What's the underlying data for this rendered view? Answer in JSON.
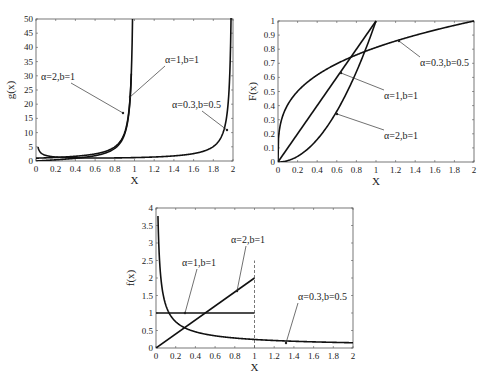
{
  "chart_data": [
    {
      "id": "hazard",
      "type": "line",
      "title": "",
      "xlabel": "X",
      "ylabel": "g(x)",
      "xlim": [
        0,
        2
      ],
      "ylim": [
        0,
        50
      ],
      "xticks": [
        "0",
        "0.2",
        "0.4",
        "0.6",
        "0.8",
        "1",
        "1.2",
        "1.4",
        "1.6",
        "1.8",
        "2"
      ],
      "yticks": [
        "0",
        "5",
        "10",
        "15",
        "20",
        "25",
        "30",
        "35",
        "40",
        "45",
        "50"
      ],
      "grid": false,
      "frame": {
        "left": 36,
        "right": 233,
        "top": 19,
        "bottom": 161
      },
      "series": [
        {
          "name": "α=2,b=1",
          "x": [
            0,
            0.2,
            0.4,
            0.6,
            0.8,
            0.9,
            0.95,
            0.97
          ],
          "values": [
            0,
            0.42,
            0.95,
            1.88,
            4.44,
            9.47,
            19.5,
            32.3
          ]
        },
        {
          "name": "α=1,b=1",
          "x": [
            0,
            0.2,
            0.4,
            0.6,
            0.8,
            0.9,
            0.95,
            0.98
          ],
          "values": [
            1,
            1.25,
            1.67,
            2.5,
            5,
            10,
            20,
            50
          ]
        },
        {
          "name": "α=0.3,b=0.5",
          "x": [
            0.05,
            0.4,
            0.8,
            1.2,
            1.6,
            1.8,
            1.9,
            1.95,
            1.99
          ],
          "values": [
            0.0,
            0.2,
            0.3,
            0.5,
            1.0,
            2.0,
            4.5,
            10,
            29
          ]
        }
      ],
      "annotations": [
        {
          "text": "α=2,b=1",
          "tx": 41,
          "ty": 80,
          "px": 123,
          "py": 113
        },
        {
          "text": "α=1,b=1",
          "tx": 165,
          "ty": 63,
          "px": 130,
          "py": 97
        },
        {
          "text": "α=0.3,b=0.5",
          "tx": 172,
          "ty": 108,
          "px": 227,
          "py": 130
        }
      ]
    },
    {
      "id": "cdf",
      "type": "line",
      "title": "",
      "xlabel": "X",
      "ylabel": "F(x)",
      "xlim": [
        0,
        2
      ],
      "ylim": [
        0,
        1
      ],
      "xticks": [
        "0",
        "0.2",
        "0.4",
        "0.6",
        "0.8",
        "1",
        "1.2",
        "1.4",
        "1.6",
        "1.8",
        "2"
      ],
      "yticks": [
        "0",
        "0.1",
        "0.2",
        "0.3",
        "0.4",
        "0.5",
        "0.6",
        "0.7",
        "0.8",
        "0.9",
        "1"
      ],
      "grid": false,
      "frame": {
        "left": 278,
        "right": 474,
        "top": 21,
        "bottom": 162
      },
      "series": [
        {
          "name": "α=0.3,b=0.5",
          "x": [
            0,
            0.02,
            0.2,
            0.4,
            0.6,
            0.8,
            1.0,
            1.2,
            1.4,
            1.6,
            1.8,
            2.0
          ],
          "values": [
            0,
            0.31,
            0.5,
            0.62,
            0.7,
            0.76,
            0.81,
            0.86,
            0.9,
            0.94,
            0.97,
            1.0
          ]
        },
        {
          "name": "α=1,b=1",
          "x": [
            0,
            1
          ],
          "values": [
            0,
            1
          ]
        },
        {
          "name": "α=2,b=1",
          "x": [
            0,
            0.2,
            0.4,
            0.6,
            0.8,
            1.0
          ],
          "values": [
            0,
            0.04,
            0.16,
            0.36,
            0.64,
            1.0
          ]
        }
      ],
      "annotations": [
        {
          "text": "α=0.3,b=0.5",
          "tx": 420,
          "ty": 66,
          "px": 399,
          "py": 41
        },
        {
          "text": "α=1,b=1",
          "tx": 384,
          "ty": 99,
          "px": 341,
          "py": 73
        },
        {
          "text": "α=2,b=1",
          "tx": 384,
          "ty": 139,
          "px": 337,
          "py": 114
        }
      ]
    },
    {
      "id": "pdf",
      "type": "line",
      "title": "",
      "xlabel": "X",
      "ylabel": "f(x)",
      "xlim": [
        0,
        2
      ],
      "ylim": [
        0,
        4
      ],
      "xticks": [
        "0",
        "0.2",
        "0.4",
        "0.6",
        "0.8",
        "1",
        "1.2",
        "1.4",
        "1.6",
        "1.8",
        "2"
      ],
      "yticks": [
        "0",
        "0.5",
        "1",
        "1.5",
        "2",
        "2.5",
        "3",
        "3.5",
        "4"
      ],
      "grid": false,
      "frame": {
        "left": 156,
        "right": 353,
        "top": 208,
        "bottom": 348
      },
      "series": [
        {
          "name": "α=1,b=1",
          "x": [
            0,
            1
          ],
          "values": [
            1,
            1
          ]
        },
        {
          "name": "α=2,b=1",
          "x": [
            0,
            1
          ],
          "values": [
            0,
            2
          ]
        },
        {
          "name": "α=0.3,b=0.5",
          "x": [
            0.01,
            0.05,
            0.1,
            0.2,
            0.3,
            0.5,
            0.8,
            1.0,
            1.4,
            2.0
          ],
          "values": [
            3.7,
            1.21,
            0.75,
            0.46,
            0.35,
            0.4,
            0.3,
            0.24,
            0.19,
            0.15
          ]
        }
      ],
      "vline": {
        "x": 1,
        "from": 0,
        "to": 2.5,
        "style": "dashed"
      },
      "annotations": [
        {
          "text": "α=2,b=1",
          "tx": 231,
          "ty": 243,
          "px": 237,
          "py": 291
        },
        {
          "text": "α=1,b=1",
          "tx": 182,
          "ty": 266,
          "px": 185,
          "py": 313
        },
        {
          "text": "α=0.3,b=0.5",
          "tx": 298,
          "ty": 300,
          "px": 286,
          "py": 343
        }
      ]
    }
  ]
}
